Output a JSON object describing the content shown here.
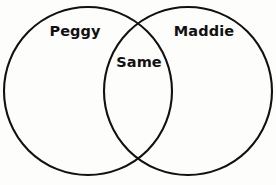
{
  "diagram": {
    "type": "venn-two-set",
    "width": 276,
    "height": 185,
    "background_color": "#fdfdfc",
    "stroke_color": "#111111",
    "stroke_width": 2.1,
    "text_color": "#111111",
    "left_set": {
      "label": "Peggy",
      "cx": 88,
      "cy": 91,
      "r": 84,
      "label_x": 75,
      "label_y": 31
    },
    "right_set": {
      "label": "Maddie",
      "cx": 188,
      "cy": 91,
      "r": 84,
      "label_x": 204,
      "label_y": 31
    },
    "intersection": {
      "label": "Same",
      "label_x": 139,
      "label_y": 62,
      "top_crossing_x": 138,
      "top_crossing_y": 13,
      "bottom_crossing_x": 138,
      "bottom_crossing_y": 168
    }
  }
}
